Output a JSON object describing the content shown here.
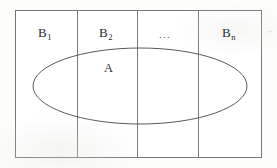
{
  "figure": {
    "name": "partition-venn-diagram",
    "background_color": "#fdfdfc",
    "line_color": "#6e6e6e",
    "ellipse_color": "#555555",
    "text_color": "#2b2b2b",
    "cells": [
      {
        "id": "b1",
        "label_base": "B",
        "label_sub": "1",
        "center_x": 46
      },
      {
        "id": "b2",
        "label_base": "B",
        "label_sub": "2",
        "center_x": 107
      },
      {
        "id": "bdots",
        "label_base": "...",
        "label_sub": "",
        "center_x": 167
      },
      {
        "id": "bn",
        "label_base": "B",
        "label_sub": "n",
        "center_x": 230
      }
    ],
    "set_label": {
      "id": "set-a",
      "text": "A",
      "x": 105,
      "y": 68
    },
    "ellipsis_text": "...",
    "scan_speck": "+",
    "geometry": {
      "rect_x": 15,
      "rect_y": 10,
      "rect_width": 247,
      "rect_height": 148,
      "divider_x": [
        77,
        137,
        198
      ],
      "ellipse_cx": 140,
      "ellipse_cy": 86,
      "ellipse_rx": 107,
      "ellipse_ry": 38
    }
  }
}
